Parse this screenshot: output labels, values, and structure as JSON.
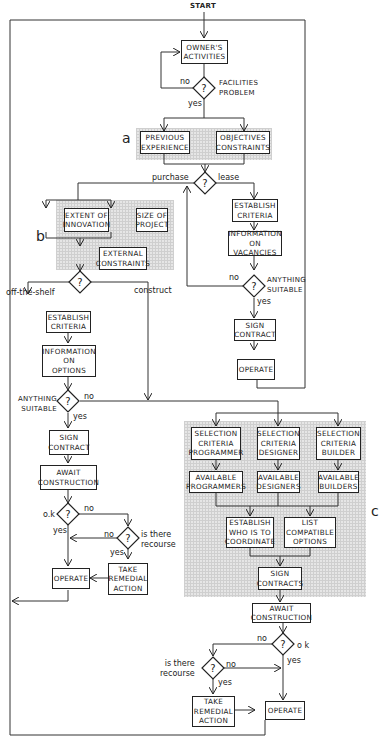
{
  "start": "START",
  "owner": {
    "activities": "OWNER'S\nACTIVITIES",
    "decision_label": "FACILITIES\nPROBLEM",
    "no": "no",
    "yes": "yes"
  },
  "section_a": {
    "label": "a",
    "previous": "PREVIOUS\nEXPERIENCE",
    "objectives": "OBJECTIVES\nCONSTRAINTS"
  },
  "purchase_lease": {
    "purchase": "purchase",
    "lease": "lease"
  },
  "lease_path": {
    "establish": "ESTABLISH\nCRITERIA",
    "info": "INFORMATION\nON VACANCIES",
    "decision_label": "ANYTHING\nSUITABLE",
    "no": "no",
    "yes": "yes",
    "sign": "SIGN\nCONTRACT",
    "operate": "OPERATE"
  },
  "section_b": {
    "label": "b",
    "extent": "EXTENT OF\nINNOVATION",
    "size": "SIZE OF\nPROJECT",
    "external": "EXTERNAL\nCONSTRAINTS"
  },
  "shelf_construct": {
    "shelf": "off-the-shelf",
    "construct": "construct"
  },
  "shelf_path": {
    "establish": "ESTABLISH\nCRITERIA",
    "info": "INFORMATION\nON\nOPTIONS",
    "decision_label": "ANYTHING\nSUITABLE",
    "no": "no",
    "yes": "yes",
    "sign": "SIGN\nCONTRACT",
    "await": "AWAIT\nCONSTRUCTION",
    "ok_label": "o.k",
    "ok_no": "no",
    "ok_yes": "yes",
    "recourse_label": "is there\nrecourse",
    "rec_no": "no",
    "rec_yes": "yes",
    "remedial": "TAKE\nREMEDIAL\nACTION",
    "operate": "OPERATE"
  },
  "section_c": {
    "label": "c",
    "sel_prog": "SELECTION\nCRITERIA\nPROGRAMMER",
    "sel_des": "SELECTION\nCRITERIA\nDESIGNER",
    "sel_build": "SELECTION\nCRITERIA\nBUILDER",
    "avail_prog": "AVAILABLE\nPROGRAMMERS",
    "avail_des": "AVAILABLE\nDESIGNERS",
    "avail_build": "AVAILABLE\nBUILDERS",
    "coordinate": "ESTABLISH\nWHO IS TO\nCOORDINATE",
    "compatible": "LIST\nCOMPATIBLE\nOPTIONS",
    "sign": "SIGN\nCONTRACTS"
  },
  "construct_path": {
    "await": "AWAIT\nCONSTRUCTION",
    "ok_label": "o k",
    "ok_no": "no",
    "ok_yes": "yes",
    "recourse_label": "is there\nrecourse",
    "rec_no": "no",
    "rec_yes": "yes",
    "remedial": "TAKE\nREMEDIAL\nACTION",
    "operate": "OPERATE"
  },
  "decision_glyph": "?"
}
